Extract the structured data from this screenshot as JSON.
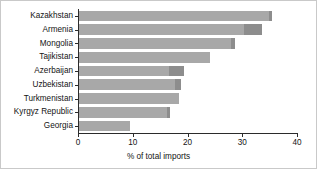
{
  "chart_data": {
    "type": "bar",
    "orientation": "horizontal",
    "title": "",
    "xlabel": "% of total imports",
    "ylabel": "",
    "xlim": [
      0,
      40
    ],
    "xticks": [
      0,
      10,
      20,
      30,
      40
    ],
    "grid": false,
    "legend": false,
    "categories": [
      "Kazakhstan",
      "Armenia",
      "Mongolia",
      "Tajikistan",
      "Azerbaijan",
      "Uzbekistan",
      "Turkmenistan",
      "Kyrgyz Republic",
      "Georgia"
    ],
    "values": [
      35.4,
      33.6,
      28.7,
      24.1,
      19.4,
      18.8,
      18.4,
      16.8,
      9.5
    ],
    "segment_breaks": [
      34.8,
      30.3,
      28.0,
      24.1,
      16.6,
      17.8,
      18.4,
      16.3,
      9.5
    ],
    "colors": {
      "bar_primary": "#a8a8a8",
      "bar_secondary": "#8d8d8d",
      "axis": "#2b2b2b",
      "text": "#141414",
      "background": "#ffffff"
    }
  }
}
